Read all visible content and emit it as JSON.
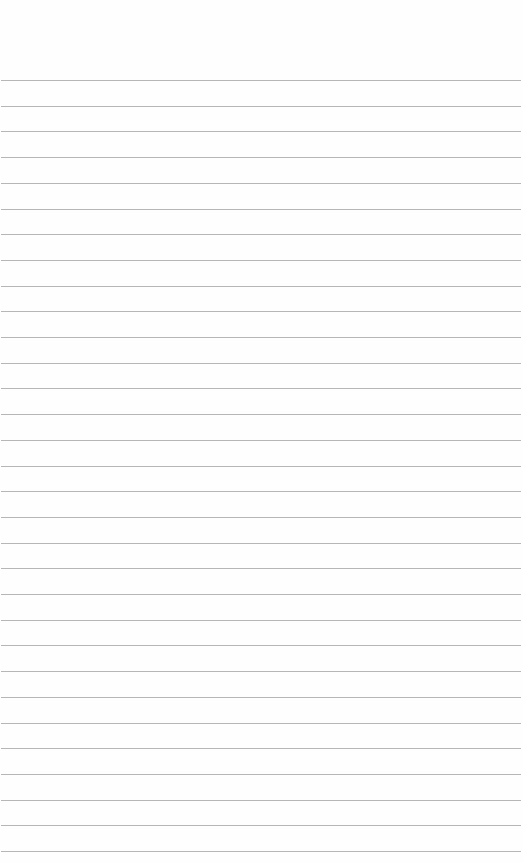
{
  "page": {
    "type": "blank lined paper",
    "background": "#fefefe",
    "rule_color": "#a9a9a9",
    "rule_count": 31,
    "first_rule_y": 80,
    "rule_spacing": 25.7
  }
}
